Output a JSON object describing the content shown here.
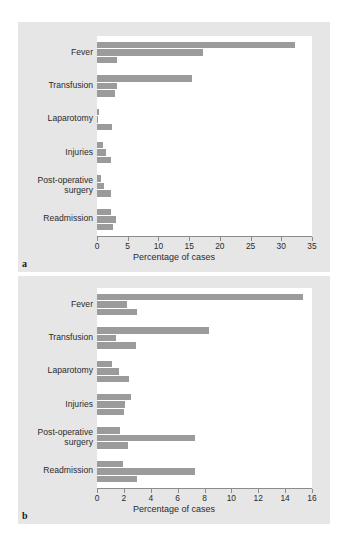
{
  "figure": {
    "background_color": "#ffffff",
    "panel_background_color": "#e6e6e6",
    "plot_background_color": "#ffffff",
    "bar_color": "#9b9b9b",
    "axis_color": "#8c8c8c"
  },
  "panels": [
    {
      "label": "a"
    },
    {
      "label": "b"
    }
  ],
  "chart_data": [
    {
      "type": "bar",
      "orientation": "horizontal",
      "panel": "a",
      "title": "",
      "xlabel": "Percentage of cases",
      "ylabel": "",
      "xlim": [
        0,
        35
      ],
      "xticks": [
        0,
        5,
        10,
        15,
        20,
        25,
        30,
        35
      ],
      "xticklabels": [
        "0",
        "5",
        "10",
        "15",
        "20",
        "25",
        "30",
        "35"
      ],
      "categories": [
        "Fever",
        "Transfusion",
        "Laparotomy",
        "Injuries",
        "Post-operative surgery",
        "Readmission"
      ],
      "bars_per_category": 3,
      "series": [
        {
          "name": "series-1",
          "values": [
            32.3,
            15.5,
            0.4,
            1.0,
            0.7,
            2.2
          ]
        },
        {
          "name": "series-2",
          "values": [
            17.3,
            3.3,
            0.2,
            1.5,
            1.1,
            3.1
          ]
        },
        {
          "name": "series-3",
          "values": [
            3.3,
            2.9,
            2.4,
            2.2,
            2.3,
            2.6
          ]
        }
      ],
      "grid": false,
      "legend": "none"
    },
    {
      "type": "bar",
      "orientation": "horizontal",
      "panel": "b",
      "title": "",
      "xlabel": "Percentage of cases",
      "ylabel": "",
      "xlim": [
        0,
        16
      ],
      "xticks": [
        0,
        2,
        4,
        6,
        8,
        10,
        12,
        14,
        16
      ],
      "xticklabels": [
        "0",
        "2",
        "4",
        "6",
        "8",
        "10",
        "12",
        "14",
        "16"
      ],
      "categories": [
        "Fever",
        "Transfusion",
        "Laparotomy",
        "Injuries",
        "Post-operative surgery",
        "Readmission"
      ],
      "bars_per_category": 3,
      "series": [
        {
          "name": "series-1",
          "values": [
            15.3,
            8.3,
            1.1,
            2.5,
            1.7,
            1.9
          ]
        },
        {
          "name": "series-2",
          "values": [
            2.2,
            1.4,
            1.6,
            2.1,
            7.3,
            7.3
          ]
        },
        {
          "name": "series-3",
          "values": [
            3.0,
            2.9,
            2.4,
            2.0,
            2.3,
            3.0
          ]
        }
      ],
      "grid": false,
      "legend": "none"
    }
  ]
}
